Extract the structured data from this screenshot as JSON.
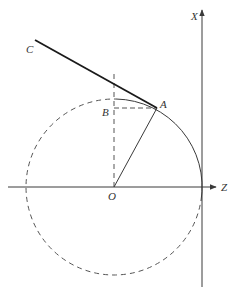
{
  "diagram": {
    "colors": {
      "line": "#3a3a3a",
      "dashed": "#555555",
      "bold": "#1a1a1a",
      "background": "#ffffff"
    },
    "labels": {
      "C": "C",
      "A": "A",
      "B": "B",
      "O": "O",
      "X": "X",
      "Z": "Z"
    },
    "points": {
      "O": [
        114,
        187
      ],
      "A": [
        157,
        108
      ],
      "B": [
        114,
        108
      ],
      "C": [
        35,
        40
      ]
    },
    "circle": {
      "center": [
        114,
        187
      ],
      "radius": 88
    },
    "axes": {
      "Z": {
        "from": [
          8,
          187
        ],
        "to": [
          216,
          187
        ],
        "label": "Z"
      },
      "X": {
        "from": [
          202,
          287
        ],
        "to": [
          202,
          10
        ],
        "label": "X"
      }
    }
  }
}
